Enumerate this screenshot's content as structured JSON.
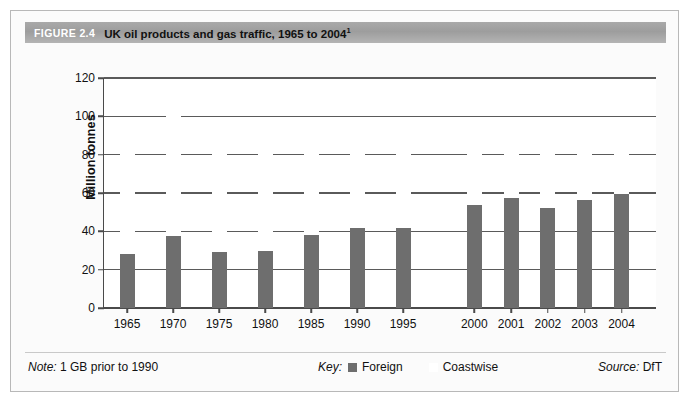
{
  "figure": {
    "number_label": "FIGURE 2.4",
    "title": "UK oil products and gas traffic, 1965 to 2004",
    "title_superscript": "1"
  },
  "footer": {
    "note_prefix": "Note:",
    "note_text": "1 GB prior to 1990",
    "key_label": "Key:",
    "source_prefix": "Source:",
    "source_text": "DfT"
  },
  "colors": {
    "foreign": "#6e6e6e",
    "coastwise": "#ffffff",
    "gridline": "#5a5a5a",
    "axis": "#4a4a4a",
    "header_band": "#a9a9a9",
    "frame": "#b8b8b8"
  },
  "chart_data": {
    "type": "bar",
    "title": "UK oil products and gas traffic, 1965 to 2004",
    "subtitle": "",
    "xlabel": "",
    "ylabel": "Million tonnes",
    "ylim": [
      0,
      120
    ],
    "ytick_step": 20,
    "yticks": [
      0,
      20,
      40,
      60,
      80,
      100,
      120
    ],
    "grid": true,
    "stacked": true,
    "legend_position": "bottom-center",
    "categories": [
      "1965",
      "1970",
      "1975",
      "1980",
      "1985",
      "1990",
      "1995",
      "2000",
      "2001",
      "2002",
      "2003",
      "2004"
    ],
    "series": [
      {
        "name": "Foreign",
        "color": "#6e6e6e",
        "values": [
          28,
          37.5,
          29,
          30,
          38,
          41.5,
          41.5,
          54,
          57.5,
          52,
          56.5,
          59.5
        ]
      },
      {
        "name": "Coastwise",
        "color": "#ffffff",
        "values": [
          60,
          69.5,
          65,
          60,
          52,
          45.5,
          45.5,
          40,
          32,
          34.5,
          33.5,
          35.5
        ]
      }
    ],
    "totals": [
      88,
      107,
      94,
      90,
      90,
      87,
      87,
      94,
      89.5,
      86.5,
      90,
      95
    ],
    "annotations": [
      "1 GB prior to 1990"
    ]
  }
}
